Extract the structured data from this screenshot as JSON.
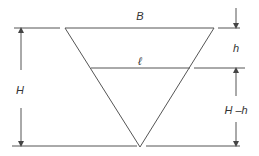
{
  "diagram": {
    "type": "inverted-triangle-cross-section",
    "colors": {
      "stroke": "#555555",
      "text": "#333333",
      "background": "#ffffff"
    },
    "labels": {
      "top_width": "B",
      "cut_width": "ℓ",
      "total_height": "H",
      "top_depth": "h",
      "lower_depth": "H –h"
    },
    "geometry": {
      "triangle": {
        "top_left": [
          65,
          28
        ],
        "top_right": [
          214,
          28
        ],
        "apex": [
          140,
          147
        ]
      },
      "cut_line_y": 68,
      "baseline_y": 146
    }
  }
}
